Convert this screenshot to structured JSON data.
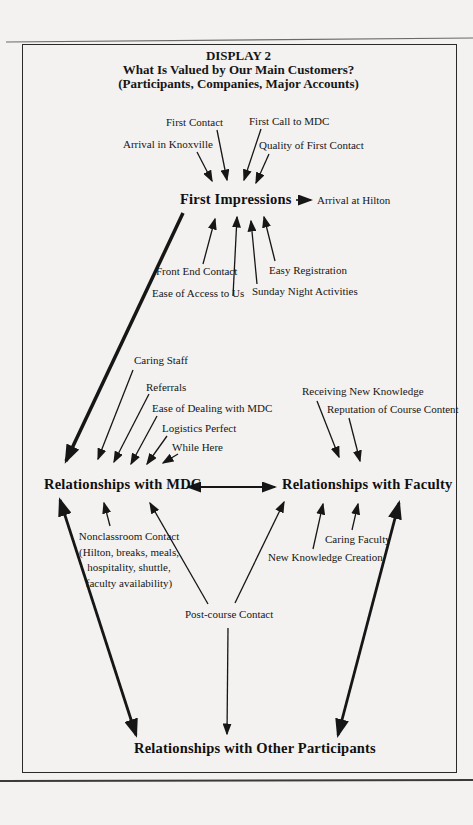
{
  "title": {
    "line1": "DISPLAY 2",
    "line2": "What Is Valued by Our Main Customers?",
    "line3": "(Participants, Companies, Major Accounts)"
  },
  "nodes": {
    "first_impressions": "First Impressions",
    "mdc": "Relationships with MDC",
    "faculty": "Relationships with Faculty",
    "participants": "Relationships with Other Participants"
  },
  "factors": {
    "first_contact": "First Contact",
    "first_call": "First Call to MDC",
    "arrival_knoxville": "Arrival in Knoxville",
    "quality_first_contact": "Quality of First Contact",
    "arrival_hilton": "Arrival at Hilton",
    "front_end_contact": "Front End Contact",
    "ease_access": "Ease of Access to Us",
    "easy_registration": "Easy Registration",
    "sunday_night": "Sunday Night Activities",
    "caring_staff": "Caring Staff",
    "referrals": "Referrals",
    "ease_dealing": "Ease of Dealing with MDC",
    "logistics_perfect": "Logistics Perfect",
    "while_here": "While Here",
    "receiving_knowledge": "Receiving New Knowledge",
    "reputation_content": "Reputation of Course Content",
    "caring_faculty": "Caring Faculty",
    "new_knowledge": "New Knowledge Creation",
    "nonclassroom_line1": "Nonclassroom Contact",
    "nonclassroom_line2": "(Hilton, breaks, meals,",
    "nonclassroom_line3": "hospitality, shuttle,",
    "nonclassroom_line4": "faculty availability)",
    "post_course": "Post-course Contact"
  },
  "colors": {
    "ink": "#161616",
    "paper": "#f3f2f0",
    "border": "#2a2a28"
  }
}
